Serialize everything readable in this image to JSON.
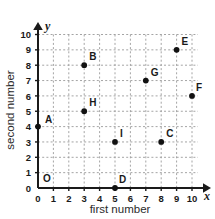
{
  "chart_data": {
    "type": "scatter",
    "title": "",
    "xlabel": "first number",
    "ylabel": "second number",
    "x_variable": "x",
    "y_variable": "y",
    "xlim": [
      0,
      10
    ],
    "ylim": [
      0,
      10
    ],
    "x_ticks": [
      "0",
      "1",
      "2",
      "3",
      "4",
      "5",
      "6",
      "7",
      "8",
      "9",
      "10"
    ],
    "y_ticks": [
      "0",
      "1",
      "2",
      "3",
      "4",
      "5",
      "6",
      "7",
      "8",
      "9",
      "10"
    ],
    "grid": true,
    "legend": "none",
    "origin_label": "O",
    "point_color": "#111111",
    "grid_color": "#9a9a9a",
    "axis_color": "#1a1a1a",
    "points": [
      {
        "label": "A",
        "x": 0,
        "y": 4,
        "label_dx": 7,
        "label_dy": -4
      },
      {
        "label": "B",
        "x": 3,
        "y": 8,
        "label_dx": 5,
        "label_dy": -5
      },
      {
        "label": "C",
        "x": 8,
        "y": 3,
        "label_dx": 5,
        "label_dy": -5
      },
      {
        "label": "D",
        "x": 5,
        "y": 0,
        "label_dx": 4,
        "label_dy": -5
      },
      {
        "label": "E",
        "x": 9,
        "y": 9,
        "label_dx": 5,
        "label_dy": -5
      },
      {
        "label": "F",
        "x": 10,
        "y": 6,
        "label_dx": 4,
        "label_dy": -5
      },
      {
        "label": "G",
        "x": 7,
        "y": 7,
        "label_dx": 5,
        "label_dy": -5
      },
      {
        "label": "H",
        "x": 3,
        "y": 5,
        "label_dx": 5,
        "label_dy": -5
      },
      {
        "label": "I",
        "x": 5,
        "y": 3,
        "label_dx": 5,
        "label_dy": -5
      }
    ]
  }
}
